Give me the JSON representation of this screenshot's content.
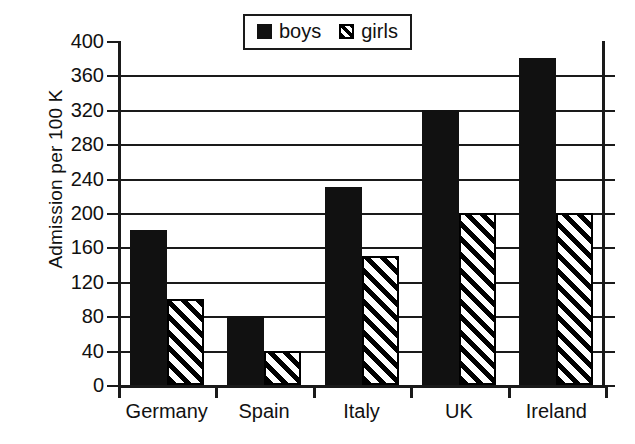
{
  "chart_data": {
    "type": "bar",
    "title": "",
    "subtitle": "",
    "xlabel": "",
    "ylabel": "Admission per 100 K",
    "categories": [
      "Germany",
      "Spain",
      "Italy",
      "UK",
      "Ireland"
    ],
    "series": [
      {
        "name": "boys",
        "values": [
          180,
          80,
          230,
          320,
          380
        ],
        "fill": "solid-black",
        "color": "#111111"
      },
      {
        "name": "girls",
        "values": [
          100,
          40,
          150,
          200,
          200
        ],
        "fill": "diagonal-hatch",
        "color": "#ffffff"
      }
    ],
    "ylim": [
      0,
      400
    ],
    "ytick_step": 40,
    "yticks": [
      0,
      40,
      80,
      120,
      160,
      200,
      240,
      280,
      320,
      360,
      400
    ],
    "ytick_labels": [
      "0",
      "40",
      "80",
      "120",
      "160",
      "200",
      "240",
      "280",
      "320",
      "360",
      "400"
    ],
    "grid": true,
    "grid_axis": "y",
    "legend_position": "top-center",
    "legend_entries": [
      "boys",
      "girls"
    ],
    "background": "#ffffff",
    "axis_color": "#1a1a1a"
  },
  "legend": {
    "boys_label": "boys",
    "girls_label": "girls"
  },
  "axes": {
    "y_title": "Admission per 100 K"
  }
}
